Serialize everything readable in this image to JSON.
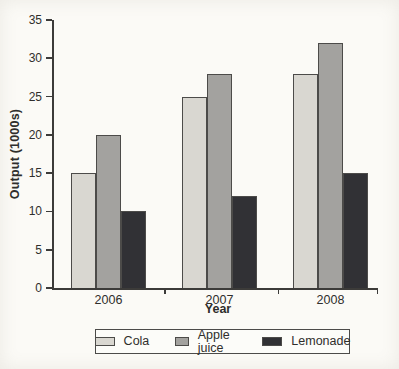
{
  "chart_data": {
    "type": "bar",
    "title": "",
    "categories": [
      "2006",
      "2007",
      "2008"
    ],
    "series": [
      {
        "name": "Cola",
        "color": "#d9d7d1",
        "values": [
          15,
          25,
          28
        ]
      },
      {
        "name": "Apple juice",
        "color": "#a3a29f",
        "values": [
          20,
          28,
          32
        ]
      },
      {
        "name": "Lemonade",
        "color": "#313135",
        "values": [
          10,
          12,
          15
        ]
      }
    ],
    "xlabel": "Year",
    "ylabel": "Output (1000s)",
    "ylim": [
      0,
      35
    ],
    "ytick_step": 5,
    "yticks": [
      0,
      5,
      10,
      15,
      20,
      25,
      30,
      35
    ],
    "grid": false,
    "legend_position": "bottom",
    "legend_labels": [
      "Cola",
      "Apple juice",
      "Lemonade"
    ],
    "axis_color": "#3c3b39",
    "bar_border_color": "#4c4b49",
    "text_color": "#2f2e2c"
  }
}
